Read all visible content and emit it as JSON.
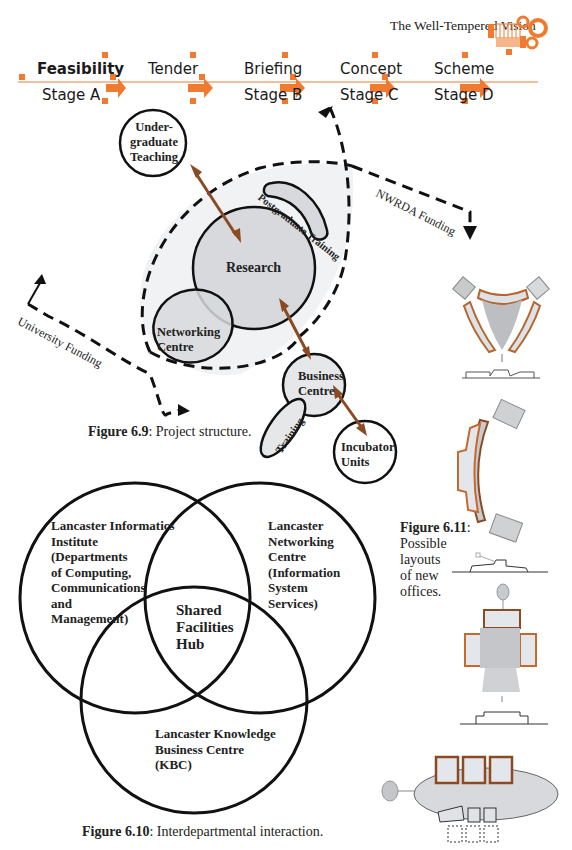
{
  "header": {
    "running_title": "The Well-Tempered Vision",
    "logo_icon": "gears-grid-icon"
  },
  "stage_bar": {
    "accent_color": "#ee7b30",
    "stages": [
      {
        "top": "Feasibility",
        "bottom": "Stage A"
      },
      {
        "top": "Tender",
        "bottom": ""
      },
      {
        "top": "Briefing",
        "bottom": "Stage B"
      },
      {
        "top": "Concept",
        "bottom": "Stage C"
      },
      {
        "top": "Scheme",
        "bottom": "Stage D"
      }
    ]
  },
  "figure_6_9": {
    "caption_label": "Figure 6.9",
    "caption_text": ": Project structure.",
    "nodes": {
      "undergraduate_teaching": [
        "Under-",
        "graduate",
        "Teaching"
      ],
      "postgraduate_training": "Postgraduate Training",
      "research": "Research",
      "networking_centre": [
        "Networking",
        "Centre"
      ],
      "business_centre": [
        "Business",
        "Centre"
      ],
      "training": "Training",
      "incubator_units": [
        "Incubator",
        "Units"
      ]
    },
    "funding": {
      "nwrda": "NWRDA Funding",
      "university": "University Funding"
    },
    "arrow_color": "#8b4a24"
  },
  "figure_6_10": {
    "caption_label": "Figure 6.10",
    "caption_text": ": Interdepartmental interaction.",
    "sets": {
      "lii": [
        "Lancaster Informatics",
        "Institute",
        "(Departments",
        "of Computing,",
        "Communications",
        "and",
        "Management)"
      ],
      "lnc": [
        "Lancaster",
        "Networking",
        "Centre",
        "(Information",
        "System",
        "Services)"
      ],
      "kbc": [
        "Lancaster Knowledge",
        "Business Centre",
        "(KBC)"
      ],
      "hub": [
        "Shared",
        "Facilities",
        "Hub"
      ]
    }
  },
  "figure_6_11": {
    "caption_label": "Figure 6.11",
    "caption_lines": [
      ":",
      "Possible",
      "layouts",
      "of new",
      "offices."
    ]
  }
}
